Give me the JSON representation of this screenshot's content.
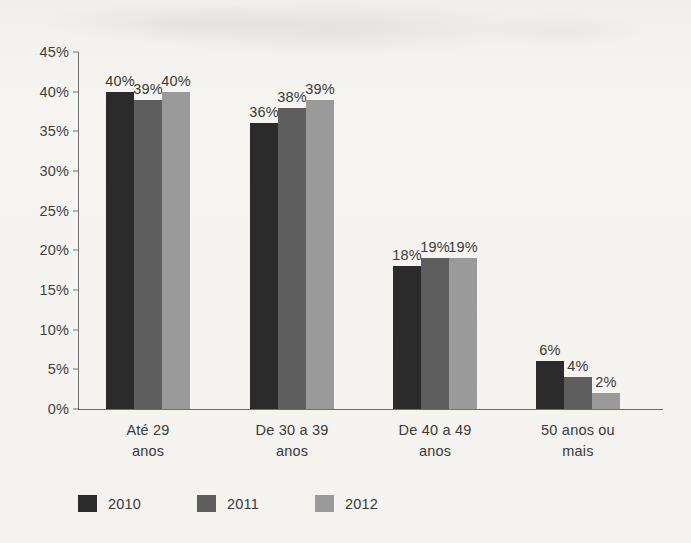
{
  "chart_data": {
    "type": "bar",
    "title": "",
    "subtitle": "",
    "xlabel": "",
    "ylabel": "",
    "categories": [
      "Até 29 anos",
      "De 30 a 39 anos",
      "De 40 a 49 anos",
      "50 anos ou mais"
    ],
    "category_lines": [
      [
        "Até 29",
        "anos"
      ],
      [
        "De 30 a 39",
        "anos"
      ],
      [
        "De 40 a 49",
        "anos"
      ],
      [
        "50 anos ou",
        "mais"
      ]
    ],
    "series": [
      {
        "name": "2010",
        "color": "#2b2b2b",
        "values": [
          40,
          36,
          18,
          6
        ],
        "labels": [
          "40%",
          "36%",
          "18%",
          "6%"
        ]
      },
      {
        "name": "2011",
        "color": "#5e5e5e",
        "values": [
          39,
          38,
          19,
          4
        ],
        "labels": [
          "39%",
          "38%",
          "19%",
          "4%"
        ]
      },
      {
        "name": "2012",
        "color": "#9a9a9a",
        "values": [
          40,
          39,
          19,
          2
        ],
        "labels": [
          "40%",
          "39%",
          "19%",
          "2%"
        ]
      }
    ],
    "ylim": [
      0,
      45
    ],
    "ytick_values": [
      0,
      5,
      10,
      15,
      20,
      25,
      30,
      35,
      40,
      45
    ],
    "ytick_labels": [
      "0%",
      "5%",
      "10%",
      "15%",
      "20%",
      "25%",
      "30%",
      "35%",
      "40%",
      "45%"
    ],
    "grid": false,
    "legend_position": "bottom-left",
    "legend_entries": [
      "2010",
      "2011",
      "2012"
    ],
    "value_labels_shown": true,
    "axis_color": "#6f6f6f",
    "background_color": "#f4f3f0"
  }
}
